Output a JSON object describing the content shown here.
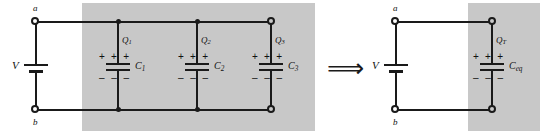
{
  "figure": {
    "transform_symbol": "⟹",
    "colors": {
      "shade": "#c8c8c8",
      "wire": "#1a1a1a",
      "background": "#ffffff"
    }
  },
  "left_circuit": {
    "source_label": "V",
    "terminal_top": "a",
    "terminal_bottom": "b",
    "branches": [
      {
        "charge_label": "Q",
        "charge_sub": "1",
        "cap_label": "C",
        "cap_sub": "1",
        "plus_signs": [
          "+",
          "+",
          "+"
        ],
        "minus_signs": [
          "–",
          "–",
          "–"
        ]
      },
      {
        "charge_label": "Q",
        "charge_sub": "2",
        "cap_label": "C",
        "cap_sub": "2",
        "plus_signs": [
          "+",
          "+",
          "+"
        ],
        "minus_signs": [
          "–",
          "–",
          "–"
        ]
      },
      {
        "charge_label": "Q",
        "charge_sub": "3",
        "cap_label": "C",
        "cap_sub": "3",
        "plus_signs": [
          "+",
          "+",
          "+"
        ],
        "minus_signs": [
          "–",
          "–",
          "–"
        ]
      }
    ]
  },
  "right_circuit": {
    "source_label": "V",
    "terminal_top": "a",
    "terminal_bottom": "b",
    "branches": [
      {
        "charge_label": "Q",
        "charge_sub": "T",
        "cap_label": "C",
        "cap_sub": "eq",
        "plus_signs": [
          "+",
          "+",
          "+"
        ],
        "minus_signs": [
          "–",
          "–",
          "–"
        ]
      }
    ]
  }
}
